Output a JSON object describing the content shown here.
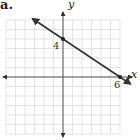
{
  "part_label": "a.",
  "chart_data": {
    "type": "line",
    "title": "",
    "xlabel": "x",
    "ylabel": "y",
    "xlim": [
      -6,
      6
    ],
    "ylim": [
      -6,
      6
    ],
    "grid": true,
    "legend": null,
    "series": [
      {
        "name": "line",
        "points": [
          [
            0,
            4
          ],
          [
            6,
            0
          ]
        ],
        "slope": -0.6667,
        "intercept": 4,
        "marked_points": [
          [
            0,
            4
          ],
          [
            6,
            0
          ]
        ]
      }
    ],
    "annotations": [
      {
        "text": "4",
        "at": [
          0,
          4
        ],
        "position": "left"
      },
      {
        "text": "6",
        "at": [
          6,
          0
        ],
        "position": "below"
      }
    ]
  },
  "labels": {
    "x_axis": "x",
    "y_axis": "y",
    "y_intercept": "4",
    "x_intercept": "6"
  },
  "colors": {
    "grid": "#d8d8d8",
    "axis": "#555555",
    "line": "#333333"
  }
}
